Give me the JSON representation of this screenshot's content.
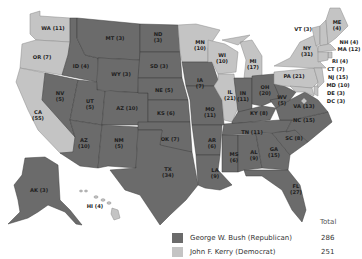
{
  "map": {
    "type": "choropleth",
    "title": "",
    "colors": {
      "republican": "#6b6b6b",
      "democrat": "#c4c4c4"
    },
    "states": [
      {
        "abbr": "WA",
        "votes": 11,
        "label": "WA (11)",
        "party": "democrat"
      },
      {
        "abbr": "OR",
        "votes": 7,
        "label": "OR (7)",
        "party": "democrat"
      },
      {
        "abbr": "CA",
        "votes": 55,
        "label": "CA (55)",
        "party": "democrat"
      },
      {
        "abbr": "ID",
        "votes": 4,
        "label": "ID (4)",
        "party": "republican"
      },
      {
        "abbr": "NV",
        "votes": 5,
        "label": "NV (5)",
        "party": "republican"
      },
      {
        "abbr": "MT",
        "votes": 3,
        "label": "MT (3)",
        "party": "republican"
      },
      {
        "abbr": "WY",
        "votes": 3,
        "label": "WY (3)",
        "party": "republican"
      },
      {
        "abbr": "UT",
        "votes": 5,
        "label": "UT (5)",
        "party": "republican"
      },
      {
        "abbr": "AZ",
        "votes": 10,
        "label": "AZ (10)",
        "party": "republican"
      },
      {
        "abbr": "CO",
        "votes": 9,
        "label": "CO (9)",
        "party": "republican"
      },
      {
        "abbr": "NM",
        "votes": 5,
        "label": "NM (5)",
        "party": "republican"
      },
      {
        "abbr": "ND",
        "votes": 3,
        "label": "ND (3)",
        "party": "republican"
      },
      {
        "abbr": "SD",
        "votes": 3,
        "label": "SD (3)",
        "party": "republican"
      },
      {
        "abbr": "NE",
        "votes": 5,
        "label": "NE (5)",
        "party": "republican"
      },
      {
        "abbr": "KS",
        "votes": 6,
        "label": "KS (6)",
        "party": "republican"
      },
      {
        "abbr": "OK",
        "votes": 7,
        "label": "OK (7)",
        "party": "republican"
      },
      {
        "abbr": "TX",
        "votes": 34,
        "label": "TX (34)",
        "party": "republican"
      },
      {
        "abbr": "MN",
        "votes": 10,
        "label": "MN (10)",
        "party": "democrat"
      },
      {
        "abbr": "IA",
        "votes": 7,
        "label": "IA (7)",
        "party": "republican"
      },
      {
        "abbr": "MO",
        "votes": 11,
        "label": "MO (11)",
        "party": "republican"
      },
      {
        "abbr": "AR",
        "votes": 6,
        "label": "AR (6)",
        "party": "republican"
      },
      {
        "abbr": "LA",
        "votes": 9,
        "label": "LA (9)",
        "party": "republican"
      },
      {
        "abbr": "WI",
        "votes": 10,
        "label": "WI (10)",
        "party": "democrat"
      },
      {
        "abbr": "IL",
        "votes": 21,
        "label": "IL (21)",
        "party": "democrat"
      },
      {
        "abbr": "MI",
        "votes": 17,
        "label": "MI (17)",
        "party": "democrat"
      },
      {
        "abbr": "IN",
        "votes": 11,
        "label": "IN (11)",
        "party": "republican"
      },
      {
        "abbr": "OH",
        "votes": 20,
        "label": "OH (20)",
        "party": "republican"
      },
      {
        "abbr": "KY",
        "votes": 8,
        "label": "KY (8)",
        "party": "republican"
      },
      {
        "abbr": "TN",
        "votes": 11,
        "label": "TN (11)",
        "party": "republican"
      },
      {
        "abbr": "MS",
        "votes": 6,
        "label": "MS (6)",
        "party": "republican"
      },
      {
        "abbr": "AL",
        "votes": 9,
        "label": "AL (9)",
        "party": "republican"
      },
      {
        "abbr": "GA",
        "votes": 15,
        "label": "GA (15)",
        "party": "republican"
      },
      {
        "abbr": "FL",
        "votes": 27,
        "label": "FL (27)",
        "party": "republican"
      },
      {
        "abbr": "SC",
        "votes": 8,
        "label": "SC (8)",
        "party": "republican"
      },
      {
        "abbr": "NC",
        "votes": 15,
        "label": "NC (15)",
        "party": "republican"
      },
      {
        "abbr": "VA",
        "votes": 13,
        "label": "VA (13)",
        "party": "republican"
      },
      {
        "abbr": "WV",
        "votes": 5,
        "label": "WV (5)",
        "party": "republican"
      },
      {
        "abbr": "PA",
        "votes": 21,
        "label": "PA (21)",
        "party": "democrat"
      },
      {
        "abbr": "NY",
        "votes": 31,
        "label": "NY (31)",
        "party": "democrat"
      },
      {
        "abbr": "VT",
        "votes": 3,
        "label": "VT (3)",
        "party": "democrat"
      },
      {
        "abbr": "ME",
        "votes": 4,
        "label": "ME (4)",
        "party": "democrat"
      },
      {
        "abbr": "NH",
        "votes": 4,
        "label": "NH (4)",
        "party": "democrat"
      },
      {
        "abbr": "MA",
        "votes": 12,
        "label": "MA (12)",
        "party": "democrat"
      },
      {
        "abbr": "RI",
        "votes": 4,
        "label": "RI (4)",
        "party": "democrat"
      },
      {
        "abbr": "CT",
        "votes": 7,
        "label": "CT (7)",
        "party": "democrat"
      },
      {
        "abbr": "NJ",
        "votes": 15,
        "label": "NJ (15)",
        "party": "democrat"
      },
      {
        "abbr": "MD",
        "votes": 10,
        "label": "MD (10)",
        "party": "democrat"
      },
      {
        "abbr": "DE",
        "votes": 3,
        "label": "DE (3)",
        "party": "democrat"
      },
      {
        "abbr": "DC",
        "votes": 3,
        "label": "DC (3)",
        "party": "democrat"
      },
      {
        "abbr": "AK",
        "votes": 3,
        "label": "AK (3)",
        "party": "republican"
      },
      {
        "abbr": "HI",
        "votes": 4,
        "label": "HI (4)",
        "party": "democrat"
      }
    ]
  },
  "legend": {
    "total_header": "Total",
    "entries": [
      {
        "name": "George W. Bush (Republican)",
        "total": "286",
        "color": "#6b6b6b"
      },
      {
        "name": "John F. Kerry (Democrat)",
        "total": "251",
        "color": "#c4c4c4"
      }
    ]
  }
}
